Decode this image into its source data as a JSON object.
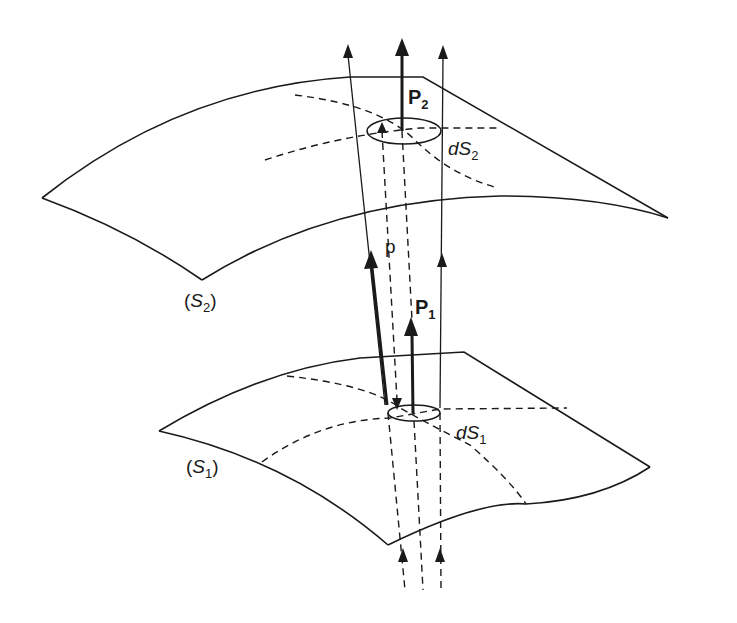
{
  "diagram": {
    "labels": {
      "surface1": {
        "open": "(",
        "name": "S",
        "sub": "1",
        "close": ")"
      },
      "surface2": {
        "open": "(",
        "name": "S",
        "sub": "2",
        "close": ")"
      },
      "area1": {
        "name": "dS",
        "sub": "1"
      },
      "area2": {
        "name": "dS",
        "sub": "2"
      },
      "vector1": {
        "name": "P",
        "sub": "1"
      },
      "vector2": {
        "name": "P",
        "sub": "2"
      },
      "ray_direction": {
        "name": "p"
      }
    },
    "colors": {
      "stroke": "#1a1a1a",
      "background": "#ffffff"
    }
  }
}
